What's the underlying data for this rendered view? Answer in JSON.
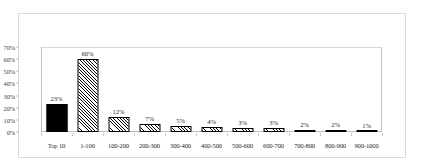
{
  "chart_data": {
    "type": "bar",
    "title": "",
    "subtitle": "",
    "xlabel": "",
    "ylabel": "",
    "categories": [
      "Top 10",
      "1-100",
      "100-200",
      "200-300",
      "300-400",
      "400-500",
      "500-600",
      "600-700",
      "700-800",
      "800-900",
      "900-1000"
    ],
    "values": [
      23,
      60,
      12,
      7,
      5,
      4,
      3,
      3,
      2,
      2,
      1
    ],
    "data_labels": [
      "23%",
      "60%",
      "12%",
      "7%",
      "5%",
      "4%",
      "3%",
      "3%",
      "2%",
      "2%",
      "1%"
    ],
    "ylim": [
      0,
      70
    ],
    "y_ticks": [
      70,
      60,
      50,
      40,
      30,
      20,
      10,
      0
    ],
    "y_tick_labels": [
      "70%",
      "60%",
      "50%",
      "40%",
      "30%",
      "20%",
      "10%",
      "0%"
    ],
    "grid": false,
    "legend": null,
    "bar_styles": [
      "solid",
      "hatched",
      "hatched",
      "hatched",
      "hatched",
      "hatched",
      "hatched",
      "hatched",
      "hatched",
      "hatched",
      "hatched"
    ],
    "colors": {
      "solid_fill": "#000000",
      "hatch_line": "#000000",
      "hatch_background": "#ffffff",
      "bar_outline": "#000000",
      "axis_line": "#bfbfbf",
      "frame_border": "#d9d9d9",
      "text": "#2b2b2b",
      "plot_background": "#ffffff"
    }
  }
}
